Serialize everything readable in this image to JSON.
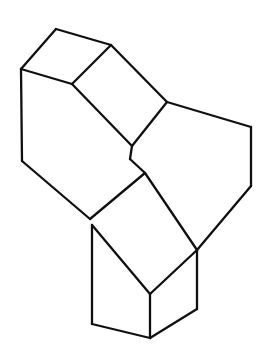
{
  "document": {
    "title": "Isometric Block Line Drawing",
    "type": "technical-line-drawing",
    "background_color": "#ffffff",
    "line_color": "#101010",
    "fill_color": "#ffffff",
    "line_width": 2.3,
    "canvas": {
      "width": 274,
      "height": 362
    }
  },
  "figure": {
    "name": "l-shaped-isometric-block",
    "projection": "isometric",
    "visible_faces": [
      {
        "id": "top-left-face",
        "label": "top-left-face"
      },
      {
        "id": "top-sloped-face",
        "label": "top-sloped-face"
      },
      {
        "id": "front-left-face",
        "label": "front-left-face"
      },
      {
        "id": "top-right-arm-face",
        "label": "top-right-arm-face"
      },
      {
        "id": "front-lower-face",
        "label": "front-lower-face"
      },
      {
        "id": "right-side-face",
        "label": "right-side-face"
      }
    ]
  },
  "geometry": {
    "outline": "M 21,69 L 56,29 L 111,45 L 167,102 L 251,127 L 251,186 L 197,250 L 197,309 L 150,338 L 92,324 L 92,225 L 22,161 Z",
    "faces": {
      "top_left_face": "M 21,69 L 56,29 L 111,45 L 72,84 Z",
      "top_sloped_face": "M 72,84 L 111,45 L 167,102 L 132,146 Z",
      "front_left_face": "M 21,69 L 72,84 L 132,146 L 130,159 L 145,173 L 90,219 L 22,161 Z",
      "top_right_arm_face": "M 167,102 L 251,127 L 197,250 L 145,173 L 130,159 L 132,146 Z",
      "front_lower_face": "M 90,219 L 145,173 L 197,250 L 197,309 L 150,338 L 92,324 L 92,225 Z",
      "right_side_face": "M 251,127 L 251,186 L 197,250 L 197,309 L 150,338 L 197,250 Z"
    },
    "edges": [
      {
        "name": "top-left-upper-left-edge",
        "d": "M 21,69 L 56,29"
      },
      {
        "name": "top-left-upper-right-edge",
        "d": "M 56,29 L 111,45"
      },
      {
        "name": "top-left-inner-right-edge",
        "d": "M 111,45 L 72,84"
      },
      {
        "name": "top-left-inner-left-edge",
        "d": "M 72,84 L 21,69"
      },
      {
        "name": "slope-upper-edge",
        "d": "M 111,45 L 167,102"
      },
      {
        "name": "slope-lower-edge",
        "d": "M 167,102 L 132,146"
      },
      {
        "name": "slope-inner-edge",
        "d": "M 132,146 L 72,84"
      },
      {
        "name": "left-vertical-edge",
        "d": "M 21,69 L 22,161"
      },
      {
        "name": "left-bottom-edge",
        "d": "M 22,161 L 90,219"
      },
      {
        "name": "front-left-lower-edge",
        "d": "M 90,219 L 145,173"
      },
      {
        "name": "notch-lower-edge",
        "d": "M 145,173 L 130,159"
      },
      {
        "name": "notch-upper-edge",
        "d": "M 130,159 L 132,146"
      },
      {
        "name": "right-arm-top-edge",
        "d": "M 167,102 L 251,127"
      },
      {
        "name": "right-far-vertical-edge",
        "d": "M 251,127 L 251,186"
      },
      {
        "name": "right-arm-slant-edge",
        "d": "M 251,186 L 197,250"
      },
      {
        "name": "right-arm-inner-edge",
        "d": "M 145,173 L 197,250"
      },
      {
        "name": "right-lower-vertical-edge",
        "d": "M 197,250 L 197,309"
      },
      {
        "name": "bottom-right-edge",
        "d": "M 197,309 L 150,338"
      },
      {
        "name": "bottom-front-edge",
        "d": "M 150,338 L 92,324"
      },
      {
        "name": "front-block-vertical-edge",
        "d": "M 92,225 L 92,324"
      },
      {
        "name": "front-block-center-vertical-edge",
        "d": "M 150,294 L 150,338"
      },
      {
        "name": "front-block-top-right-edge",
        "d": "M 150,294 L 197,250"
      },
      {
        "name": "front-block-top-left-edge",
        "d": "M 92,225 L 150,294"
      }
    ]
  }
}
